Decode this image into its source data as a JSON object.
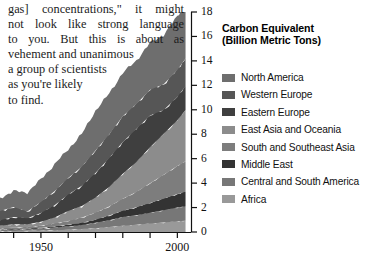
{
  "prose": {
    "lines": [
      "gas] concentrations,\" it might",
      "not look like strong language",
      "to you. But this is about as",
      "vehement and unanimous",
      "a group of scientists",
      "as  you're  likely",
      "to find."
    ]
  },
  "legend": {
    "title_line1": "Carbon Equivalent",
    "title_line2": "(Billion Metric Tons)",
    "items": [
      {
        "label": "North America",
        "color": "#6e6e6e"
      },
      {
        "label": "Western Europe",
        "color": "#565656"
      },
      {
        "label": "Eastern Europe",
        "color": "#3f3f3f"
      },
      {
        "label": "East Asia and Oceania",
        "color": "#8c8c8c"
      },
      {
        "label": "South and Southeast Asia",
        "color": "#7d7d7d"
      },
      {
        "label": "Middle East",
        "color": "#333333"
      },
      {
        "label": "Central and South America",
        "color": "#777777"
      },
      {
        "label": "Africa",
        "color": "#999999"
      }
    ]
  },
  "chart_data": {
    "type": "area",
    "title": "Carbon Equivalent (Billion Metric Tons)",
    "xlabel": "",
    "ylabel": "Carbon Equivalent (Billion Metric Tons)",
    "xlim": [
      1935,
      2005
    ],
    "ylim": [
      0,
      18
    ],
    "ytick_values": [
      0,
      2,
      4,
      6,
      8,
      10,
      12,
      14,
      16,
      18
    ],
    "ytick_labels": [
      "0",
      "2",
      "4",
      "6",
      "8",
      "10",
      "12",
      "14",
      "16",
      "18"
    ],
    "xtick_values": [
      1940,
      1950,
      1960,
      1970,
      1980,
      1990,
      2000
    ],
    "xtick_labels": [
      "",
      "1950",
      "",
      "",
      "",
      "",
      "2000"
    ],
    "grid": false,
    "legend_position": "right",
    "stacked": true,
    "x": [
      1935,
      1940,
      1945,
      1950,
      1955,
      1960,
      1965,
      1970,
      1975,
      1980,
      1985,
      1990,
      1995,
      2000,
      2003
    ],
    "series": [
      {
        "name": "Africa",
        "color": "#999999",
        "values": [
          0.08,
          0.09,
          0.1,
          0.12,
          0.15,
          0.19,
          0.24,
          0.31,
          0.4,
          0.52,
          0.6,
          0.7,
          0.78,
          0.88,
          0.93
        ]
      },
      {
        "name": "Central and South America",
        "color": "#777777",
        "values": [
          0.1,
          0.11,
          0.13,
          0.16,
          0.21,
          0.27,
          0.34,
          0.44,
          0.56,
          0.7,
          0.78,
          0.88,
          1.0,
          1.12,
          1.18
        ]
      },
      {
        "name": "Middle East",
        "color": "#333333",
        "values": [
          0.02,
          0.03,
          0.04,
          0.06,
          0.09,
          0.13,
          0.18,
          0.26,
          0.38,
          0.52,
          0.65,
          0.8,
          0.95,
          1.1,
          1.18
        ]
      },
      {
        "name": "South and Southeast Asia",
        "color": "#7d7d7d",
        "values": [
          0.1,
          0.12,
          0.14,
          0.18,
          0.24,
          0.32,
          0.42,
          0.56,
          0.74,
          0.98,
          1.25,
          1.6,
          1.95,
          2.3,
          2.5
        ]
      },
      {
        "name": "East Asia and Oceania",
        "color": "#8c8c8c",
        "values": [
          0.22,
          0.28,
          0.22,
          0.32,
          0.5,
          0.8,
          0.95,
          1.25,
          1.6,
          2.05,
          2.45,
          2.95,
          3.35,
          3.75,
          4.2
        ]
      },
      {
        "name": "Eastern Europe",
        "color": "#3f3f3f",
        "values": [
          0.45,
          0.6,
          0.5,
          0.72,
          1.0,
          1.35,
          1.65,
          2.0,
          2.35,
          2.6,
          2.7,
          2.6,
          1.95,
          1.9,
          1.95
        ]
      },
      {
        "name": "Western Europe",
        "color": "#565656",
        "values": [
          0.75,
          0.82,
          0.55,
          0.9,
          1.15,
          1.35,
          1.55,
          1.85,
          1.95,
          2.1,
          2.05,
          2.1,
          2.1,
          2.2,
          2.25
        ]
      },
      {
        "name": "North America",
        "color": "#6e6e6e",
        "values": [
          1.05,
          1.3,
          1.55,
          1.85,
          2.2,
          2.35,
          2.7,
          3.25,
          3.35,
          3.55,
          3.55,
          3.85,
          4.05,
          4.4,
          4.45
        ]
      }
    ],
    "totals": [
      2.77,
      3.35,
      3.23,
      4.31,
      5.54,
      6.76,
      8.03,
      9.92,
      11.33,
      13.02,
      14.03,
      15.48,
      16.13,
      17.65,
      18.64
    ]
  }
}
